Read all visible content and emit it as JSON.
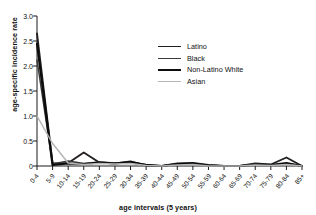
{
  "figure": {
    "title_cropped": "",
    "xlabel": "age intervals (5 years)",
    "ylabel": "age-specific incidence rate"
  },
  "legend": {
    "position": "upper-right-inside",
    "items": [
      {
        "label": "Latino",
        "color": "#231f20",
        "width": 1.9
      },
      {
        "label": "Black",
        "color": "#3a3a3c",
        "width": 1.5
      },
      {
        "label": "Non-Latino White",
        "color": "#0d0d0d",
        "width": 2.2
      },
      {
        "label": "Asian",
        "color": "#b5b5b8",
        "width": 1.5
      }
    ]
  },
  "chart_data": {
    "type": "line",
    "title": "",
    "xlabel": "age intervals (5 years)",
    "ylabel": "age-specific incidence rate",
    "grid": false,
    "legend_position": "upper right",
    "ylim": [
      0,
      3.0
    ],
    "yticks": [
      "0",
      "0.5",
      "1.0",
      "1.5",
      "2.0",
      "2.5",
      "3.0"
    ],
    "ytick_values": [
      0,
      0.5,
      1.0,
      1.5,
      2.0,
      2.5,
      3.0
    ],
    "categories": [
      "0-4",
      "5-9",
      "10-14",
      "15-19",
      "20-24",
      "25-29",
      "30-34",
      "35-39",
      "40-44",
      "45-49",
      "50-54",
      "55-59",
      "60-64",
      "65-69",
      "70-74",
      "75-79",
      "80-84",
      "85+"
    ],
    "series": [
      {
        "name": "Latino",
        "color": "#231f20",
        "values": [
          2.65,
          0.05,
          0.06,
          0.27,
          0.07,
          0.05,
          0.09,
          0.01,
          0.0,
          0.05,
          0.06,
          0.02,
          0.0,
          0.0,
          0.05,
          0.03,
          0.17,
          0.0
        ]
      },
      {
        "name": "Black",
        "color": "#3a3a3c",
        "values": [
          2.12,
          0.04,
          0.1,
          0.05,
          0.08,
          0.06,
          0.07,
          0.03,
          0.0,
          0.03,
          0.04,
          0.02,
          0.0,
          0.0,
          0.04,
          0.02,
          0.05,
          0.0
        ]
      },
      {
        "name": "Non-Latino White",
        "color": "#0d0d0d",
        "values": [
          2.45,
          0.02,
          0.05,
          0.04,
          0.07,
          0.05,
          0.08,
          0.02,
          0.0,
          0.04,
          0.05,
          0.01,
          0.0,
          0.0,
          0.03,
          0.02,
          0.06,
          0.0
        ]
      },
      {
        "name": "Asian",
        "color": "#b5b5b8",
        "values": [
          1.0,
          0.45,
          0.06,
          0.03,
          0.05,
          0.04,
          0.05,
          0.01,
          0.0,
          0.02,
          0.03,
          0.0,
          0.0,
          0.0,
          0.02,
          0.01,
          0.03,
          0.0
        ]
      }
    ]
  }
}
